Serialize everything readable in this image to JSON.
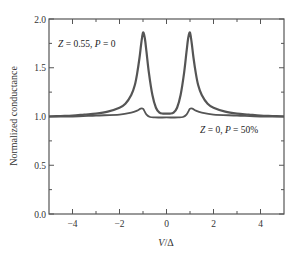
{
  "chart_data": {
    "type": "line",
    "title": "",
    "xlabel": "V/Δ",
    "ylabel": "Normalized conductance",
    "xlim": [
      -5,
      5
    ],
    "ylim": [
      0.0,
      2.0
    ],
    "x_ticks": [
      -4,
      -2,
      0,
      2,
      4
    ],
    "x_tick_labels": [
      "−4",
      "−2",
      "0",
      "2",
      "4"
    ],
    "x_minor_ticks": [
      -3,
      -1,
      1,
      3
    ],
    "y_ticks": [
      0.0,
      0.5,
      1.0,
      1.5,
      2.0
    ],
    "y_tick_labels": [
      "0.0",
      "0.5",
      "1.0",
      "1.5",
      "2.0"
    ],
    "y_minor_ticks": [
      0.25,
      0.75,
      1.25,
      1.75
    ],
    "grid": false,
    "legend": null,
    "annotations": [
      {
        "text_parts": [
          "Z",
          " = 0.55, ",
          "P",
          " = 0"
        ],
        "x": -4.6,
        "y": 1.82
      },
      {
        "text_parts": [
          "Z",
          " = 0, ",
          "P",
          " = 50%"
        ],
        "x": 0.9,
        "y": 0.91
      }
    ],
    "series": [
      {
        "name": "Z = 0.55, P = 0",
        "x": [
          -5,
          -4.5,
          -4,
          -3.5,
          -3,
          -2.5,
          -2,
          -1.75,
          -1.5,
          -1.35,
          -1.25,
          -1.15,
          -1.08,
          -1.02,
          -0.98,
          -0.92,
          -0.85,
          -0.75,
          -0.6,
          -0.45,
          -0.3,
          -0.15,
          0,
          0.15,
          0.3,
          0.45,
          0.6,
          0.75,
          0.85,
          0.92,
          0.98,
          1.02,
          1.08,
          1.15,
          1.25,
          1.35,
          1.5,
          1.75,
          2,
          2.5,
          3,
          3.5,
          4,
          4.5,
          5
        ],
        "y": [
          1.0,
          1.005,
          1.01,
          1.02,
          1.03,
          1.05,
          1.09,
          1.13,
          1.22,
          1.32,
          1.44,
          1.6,
          1.74,
          1.84,
          1.86,
          1.8,
          1.66,
          1.45,
          1.22,
          1.09,
          1.04,
          1.03,
          1.03,
          1.03,
          1.04,
          1.09,
          1.22,
          1.45,
          1.66,
          1.8,
          1.86,
          1.84,
          1.74,
          1.6,
          1.44,
          1.32,
          1.22,
          1.13,
          1.09,
          1.05,
          1.03,
          1.02,
          1.01,
          1.005,
          1.0
        ],
        "color": "#555555"
      },
      {
        "name": "Z = 0, P = 50%",
        "x": [
          -5,
          -4,
          -3,
          -2,
          -1.5,
          -1.25,
          -1.1,
          -1.0,
          -0.95,
          -0.85,
          -0.7,
          -0.5,
          0,
          0.5,
          0.7,
          0.85,
          0.95,
          1.0,
          1.1,
          1.25,
          1.5,
          2,
          3,
          4,
          5
        ],
        "y": [
          1.0,
          1.0,
          1.01,
          1.02,
          1.04,
          1.06,
          1.08,
          1.08,
          1.06,
          1.02,
          0.995,
          0.99,
          0.99,
          0.99,
          0.995,
          1.02,
          1.06,
          1.08,
          1.08,
          1.06,
          1.04,
          1.02,
          1.01,
          1.0,
          1.0
        ],
        "color": "#555555"
      }
    ]
  }
}
